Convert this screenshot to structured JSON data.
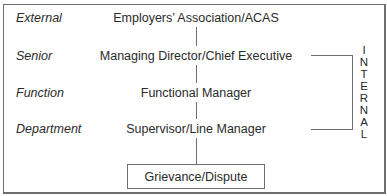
{
  "levels": [
    {
      "label": "External",
      "node": "Employers’ Association/ACAS"
    },
    {
      "label": "Senior",
      "node": "Managing Director/Chief Executive"
    },
    {
      "label": "Function",
      "node": "Functional Manager"
    },
    {
      "label": "Department",
      "node": "Supervisor/Line Manager"
    }
  ],
  "origin": {
    "label": "Grievance/Dispute"
  },
  "bracket": {
    "label": "INTERNAL",
    "letters": [
      "I",
      "N",
      "T",
      "E",
      "R",
      "N",
      "A",
      "L"
    ]
  },
  "colors": {
    "line": "#6e6e6e",
    "text": "#2a2a2a",
    "background": "#ffffff"
  }
}
